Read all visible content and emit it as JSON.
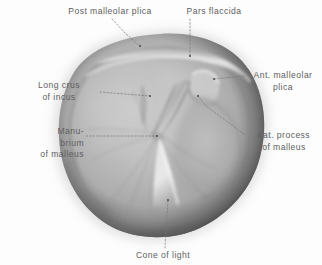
{
  "figure": {
    "background_color": "#fdfdfd",
    "label_color": "#5e5e5e",
    "leader_color": "#7a7a7a"
  },
  "labels": {
    "post_malleolar_plica": "Post malleolar plica",
    "pars_flaccida": "Pars flaccida",
    "ant_malleolar_plica": "Ant. malleolar\nplica",
    "long_crus_of_incus": "Long crus\nof incus",
    "manubrium_of_malleus": "Manu-\nbrium\nof malleus",
    "lat_process_of_malleus": "Lat. process\nof malleus",
    "cone_of_light": "Cone of light"
  },
  "anatomy": {
    "structures": [
      {
        "name": "post-malleolar-plica",
        "label": "Post malleolar plica",
        "point": [
          168,
          57
        ],
        "description": "Posterior malleolar fold along upper membrane ridge"
      },
      {
        "name": "pars-flaccida",
        "label": "Pars flaccida",
        "point": [
          190,
          62
        ],
        "description": "Shrapnell's membrane, flaccid upper portion"
      },
      {
        "name": "ant-malleolar-plica",
        "label": "Ant. malleolar plica",
        "point": [
          214,
          79
        ],
        "description": "Anterior malleolar fold"
      },
      {
        "name": "long-crus-of-incus",
        "label": "Long crus of incus",
        "point": [
          149,
          96
        ],
        "description": "Long process of incus seen through membrane"
      },
      {
        "name": "manubrium-of-malleus",
        "label": "Manubrium of malleus",
        "point": [
          157,
          136
        ],
        "description": "Handle of malleus terminating at umbo"
      },
      {
        "name": "lat-process-of-malleus",
        "label": "Lat. process of malleus",
        "point": [
          202,
          93
        ],
        "description": "Short lateral process bulge of malleus"
      },
      {
        "name": "cone-of-light",
        "label": "Cone of light",
        "point": [
          174,
          192
        ],
        "description": "Triangular light reflex in antero-inferior quadrant"
      }
    ]
  }
}
